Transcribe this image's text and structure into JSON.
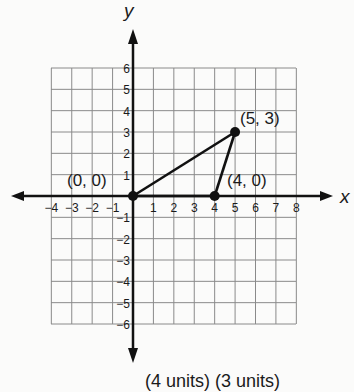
{
  "chart_data": {
    "type": "scatter",
    "title": "",
    "xlabel": "x",
    "ylabel": "y",
    "xlim": [
      -4,
      8
    ],
    "ylim": [
      -6,
      6
    ],
    "grid": true,
    "x_ticks": [
      "-4",
      "-3",
      "-2",
      "-1",
      "1",
      "2",
      "3",
      "4",
      "5",
      "6",
      "7",
      "8"
    ],
    "y_ticks": [
      "6",
      "5",
      "4",
      "3",
      "2",
      "1",
      "-1",
      "-2",
      "-3",
      "-4",
      "-5",
      "-6"
    ],
    "points": [
      {
        "x": 0,
        "y": 0,
        "label": "(0, 0)"
      },
      {
        "x": 5,
        "y": 3,
        "label": "(5, 3)"
      },
      {
        "x": 4,
        "y": 0,
        "label": "(4, 0)"
      }
    ],
    "segments": [
      {
        "from": [
          0,
          0
        ],
        "to": [
          5,
          3
        ]
      },
      {
        "from": [
          5,
          3
        ],
        "to": [
          4,
          0
        ]
      },
      {
        "from": [
          0,
          0
        ],
        "to": [
          4,
          0
        ]
      }
    ]
  },
  "labels": {
    "x_axis": "x",
    "y_axis": "y",
    "p_origin": "(0, 0)",
    "p_a": "(5, 3)",
    "p_b": "(4, 0)",
    "caption": "(4 units) (3 units)"
  },
  "colors": {
    "grid": "#8a8a8a",
    "ink": "#111111"
  }
}
